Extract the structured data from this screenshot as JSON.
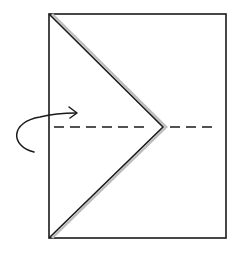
{
  "diagram": {
    "type": "origami-fold-instruction",
    "background": "#ffffff",
    "stroke_color": "#1a1a1a",
    "paper": {
      "x": 49,
      "y": 14,
      "width": 177,
      "height": 224
    },
    "folded_flap": {
      "points": [
        [
          49,
          14
        ],
        [
          163,
          127
        ],
        [
          49,
          238
        ]
      ],
      "shadow_color": "#bdbdbd"
    },
    "valley_fold_line": {
      "x1": 54,
      "y1": 127,
      "x2": 218,
      "y2": 127,
      "dash": "10 6"
    },
    "fold_arrow": {
      "icon": "curved-arrow-icon",
      "direction": "fold-over-toward-front",
      "path": "M 34 152 C 10 146, 10 122, 40 117 C 52 114, 64 113, 76 113"
    }
  }
}
